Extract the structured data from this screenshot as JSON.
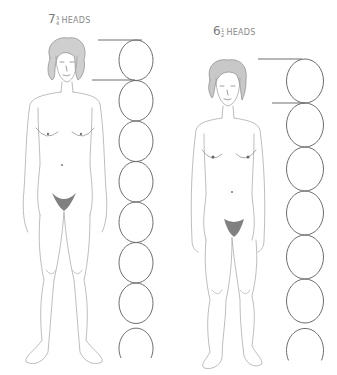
{
  "figures": [
    {
      "id": "left",
      "label": {
        "whole": "7",
        "numerator": "3",
        "denominator": "4",
        "word": "HEADS"
      },
      "heads_count": 7.75,
      "full_ovals": 7,
      "partial_oval": true
    },
    {
      "id": "right",
      "label": {
        "whole": "6",
        "numerator": "1",
        "denominator": "2",
        "word": "HEADS"
      },
      "heads_count": 6.5,
      "full_ovals": 6,
      "partial_oval": true
    }
  ],
  "colors": {
    "stroke": "#6e6e6e",
    "sketch": "#9a9a9a",
    "shade": "#555555",
    "label": "#8a8a8a"
  }
}
